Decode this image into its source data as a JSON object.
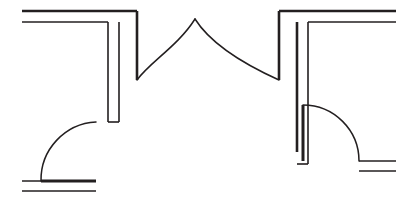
{
  "drawing": {
    "title": "Architectural Floor Plan Fragment",
    "type": "floor-plan",
    "width": 416,
    "height": 206,
    "background_color": "#ffffff",
    "line_color": "#231f20",
    "units": "pixels"
  },
  "style": {
    "wall_thin_width": 1.6,
    "wall_thick_width": 2.6,
    "door_arc_width": 1.5,
    "door_leaf_width": 3.0
  },
  "walls": [
    {
      "id": "top-left-wall",
      "label": "Top Left Horizontal Wall",
      "orientation": "horizontal",
      "outer_line": "M 22,11 L 137,11",
      "inner_line": "M 22,22 L 108,22"
    },
    {
      "id": "left-vertical-wall",
      "label": "Left Vertical Wall",
      "orientation": "vertical",
      "outer_line": "M 137,11 L 137,80",
      "inner_line": "M 108,22 L 108,122"
    },
    {
      "id": "left-vertical-wall-inner-return",
      "label": "Left Vertical Wall Inner Return",
      "orientation": "vertical",
      "line": "M 119,22 L 119,122"
    },
    {
      "id": "left-jamb-cap",
      "label": "Left Door Jamb Cap",
      "orientation": "horizontal",
      "line": "M 108,122 L 119,122"
    },
    {
      "id": "top-right-wall",
      "label": "Top Right Horizontal Wall",
      "orientation": "horizontal",
      "outer_line": "M 279,11 L 396,11",
      "inner_line": "M 308,22 L 396,22"
    },
    {
      "id": "right-vertical-wall",
      "label": "Right Vertical Wall",
      "orientation": "vertical",
      "outer_line": "M 279,11 L 279,80",
      "inner_line": "M 308,22 L 308,164"
    },
    {
      "id": "right-vertical-wall-inner-return",
      "label": "Right Vertical Wall Inner Return",
      "orientation": "vertical",
      "line": "M 297,22 L 297,152"
    },
    {
      "id": "right-jamb-cap",
      "label": "Right Door Jamb Cap",
      "orientation": "horizontal",
      "line": "M 297,164 L 308,164"
    },
    {
      "id": "bottom-left-wall",
      "label": "Bottom Left Horizontal Wall",
      "orientation": "horizontal",
      "outer_line": "M 22,181 L 96,181",
      "inner_line": "M 22,191 L 96,191"
    },
    {
      "id": "bottom-right-wall",
      "label": "Bottom Right Horizontal Wall",
      "orientation": "horizontal",
      "outer_line": "M 359,161 L 396,161",
      "inner_line": "M 359,171 L 396,171"
    }
  ],
  "doors": [
    {
      "id": "double-door-center",
      "label": "Center Double Door",
      "swing": "double",
      "opening_span": [
        137,
        279
      ],
      "peak": [
        195,
        19
      ],
      "left_arc": "M 137,80 C 150,62 178,46 195,19",
      "right_arc": "M 195,19 C 212,46 248,66 279,80",
      "left_hinge": [
        137,
        80
      ],
      "right_hinge": [
        279,
        80
      ]
    },
    {
      "id": "door-bottom-left",
      "label": "Bottom Left Door",
      "swing": "single-left",
      "hinge": [
        96,
        122
      ],
      "latch": [
        41,
        181
      ],
      "arc": "M 96,122 A 58,58 0 0 0 41,181",
      "leaf": "M 41,181 L 96,181"
    },
    {
      "id": "door-bottom-right",
      "label": "Bottom Right Door",
      "swing": "single-right",
      "hinge": [
        303,
        105
      ],
      "latch": [
        359,
        161
      ],
      "arc": "M 303,105 A 56,56 0 0 1 359,161",
      "leaf": "M 303,105 L 303,161"
    }
  ]
}
